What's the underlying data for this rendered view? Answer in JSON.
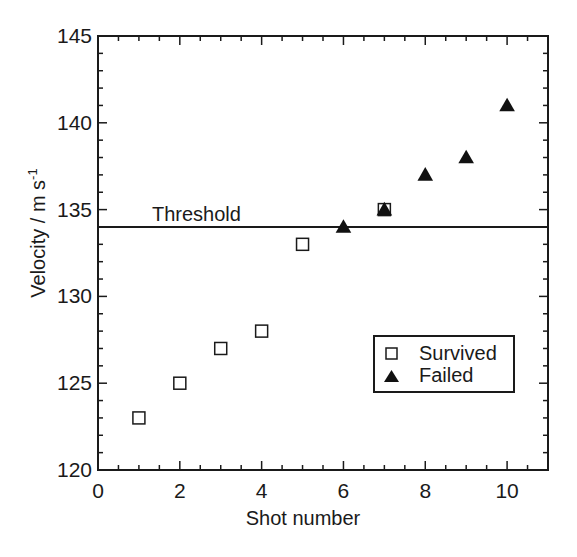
{
  "chart_data": {
    "type": "scatter",
    "title": "",
    "xlabel": "Shot number",
    "ylabel": "Velocity / m s",
    "ylabel_superscript": "-1",
    "xlim": [
      0,
      11
    ],
    "ylim": [
      120,
      145
    ],
    "xticks": [
      "0",
      "2",
      "4",
      "6",
      "8",
      "10"
    ],
    "yticks": [
      "120",
      "125",
      "130",
      "135",
      "140",
      "145"
    ],
    "grid": false,
    "legend_position": "lower right (inside)",
    "series": [
      {
        "name": "Survived",
        "marker": "open-square",
        "points": [
          [
            1,
            123
          ],
          [
            2,
            125
          ],
          [
            3,
            127
          ],
          [
            4,
            128
          ],
          [
            5,
            133
          ],
          [
            7,
            135
          ]
        ]
      },
      {
        "name": "Failed",
        "marker": "filled-triangle",
        "points": [
          [
            6,
            134
          ],
          [
            7,
            135
          ],
          [
            8,
            137
          ],
          [
            9,
            138
          ],
          [
            10,
            141
          ]
        ]
      }
    ],
    "annotations": [
      {
        "type": "hline",
        "y": 134,
        "label": "Threshold"
      }
    ]
  },
  "legend": {
    "items": [
      {
        "label": "Survived",
        "icon": "open-square-icon"
      },
      {
        "label": "Failed",
        "icon": "filled-triangle-icon"
      }
    ]
  },
  "threshold_label": "Threshold"
}
